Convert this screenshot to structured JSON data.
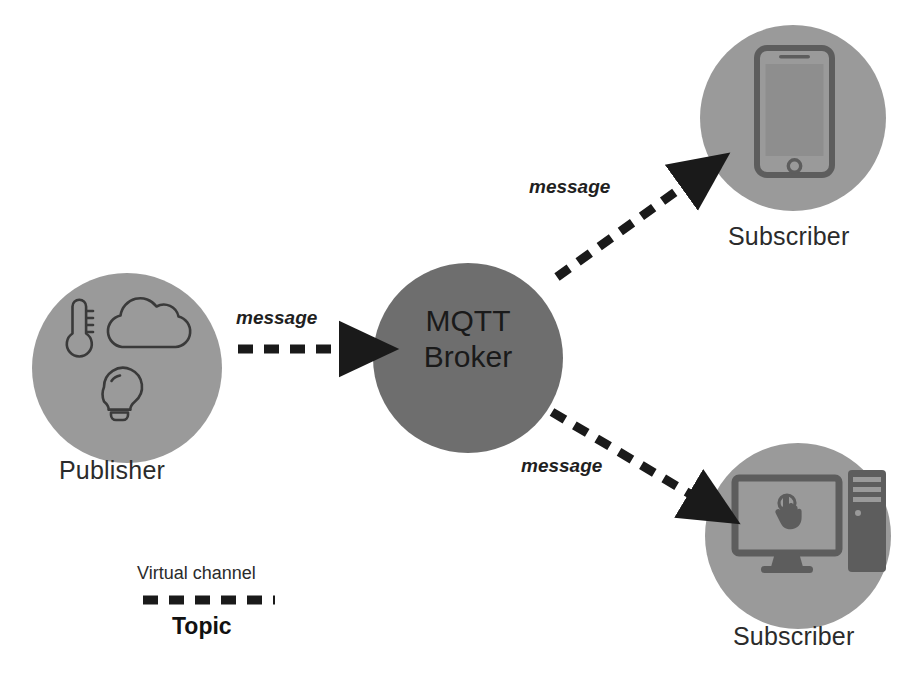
{
  "diagram": {
    "background_color": "#ffffff",
    "colors": {
      "node_fill": "#9a9a9a",
      "broker_fill": "#6e6e6e",
      "icon_stroke": "#3c3c3c",
      "device_icon": "#5f5f5f",
      "arrow": "#1a1a1a",
      "text": "#2b2b2b"
    }
  },
  "nodes": {
    "publisher": {
      "label": "Publisher",
      "fill": "#9a9a9a",
      "icons": [
        "thermometer-icon",
        "cloud-icon",
        "lightbulb-icon"
      ]
    },
    "broker": {
      "line1": "MQTT",
      "line2": "Broker",
      "fill": "#6e6e6e"
    },
    "subscriber_top": {
      "label": "Subscriber",
      "fill": "#9a9a9a",
      "icon": "smartphone-icon"
    },
    "subscriber_bottom": {
      "label": "Subscriber",
      "fill": "#9a9a9a",
      "icon": "desktop-computer-icon"
    }
  },
  "arrows": {
    "publisher_to_broker": {
      "label": "message",
      "style": "dashed"
    },
    "broker_to_subscriber_top": {
      "label": "message",
      "style": "dashed"
    },
    "broker_to_subscriber_bottom": {
      "label": "message",
      "style": "dashed"
    }
  },
  "legend": {
    "caption": "Virtual channel",
    "name": "Topic",
    "line_style": "dashed"
  }
}
